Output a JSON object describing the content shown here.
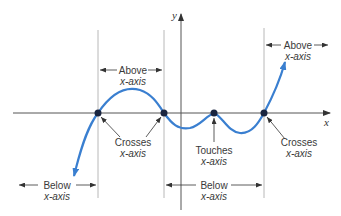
{
  "diagram": {
    "axes": {
      "x_label": "x",
      "y_label": "y"
    },
    "colors": {
      "curve": "#3a7fd0",
      "axis": "#444444",
      "guide": "#b8b8b8",
      "point": "#1a2540",
      "text": "#3a3a3a"
    },
    "regions": [
      {
        "id": "below-left",
        "line1": "Below",
        "line2": "x-axis"
      },
      {
        "id": "above-1",
        "line1": "Above",
        "line2": "x-axis"
      },
      {
        "id": "below-middle",
        "line1": "Below",
        "line2": "x-axis"
      },
      {
        "id": "above-right",
        "line1": "Above",
        "line2": "x-axis"
      }
    ],
    "point_labels": [
      {
        "id": "crosses-1",
        "line1": "Crosses",
        "line2": "x-axis"
      },
      {
        "id": "touches",
        "line1": "Touches",
        "line2": "x-axis"
      },
      {
        "id": "crosses-2",
        "line1": "Crosses",
        "line2": "x-axis"
      }
    ]
  }
}
